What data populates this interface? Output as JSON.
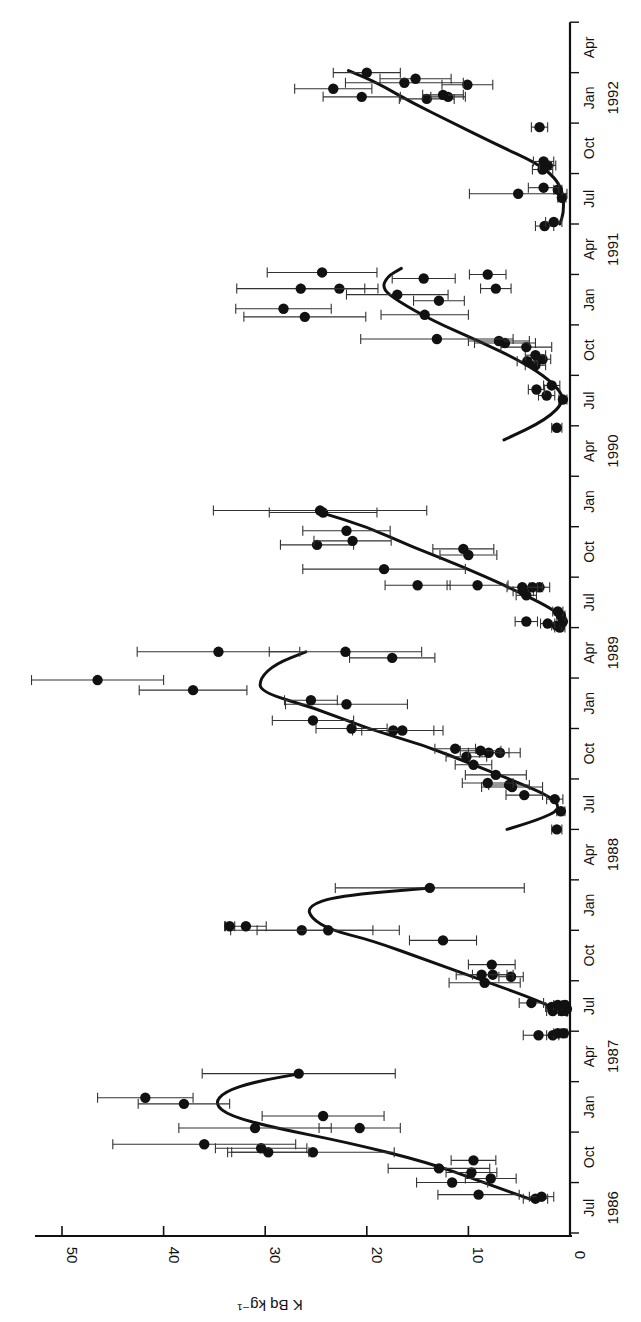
{
  "chart_data": {
    "type": "scatter",
    "orientation": "rotated-90-clockwise",
    "title": "",
    "ylabel": "K Bq kg⁻¹",
    "xlabel": "",
    "ylim": [
      0,
      52
    ],
    "xlim": [
      1986.5,
      1992.5
    ],
    "value_ticks": [
      0,
      10,
      20,
      30,
      40,
      50
    ],
    "month_labels": [
      "Jul",
      "Oct",
      "Jan",
      "Apr",
      "Jul",
      "Oct",
      "Jan",
      "Apr",
      "Jul",
      "Oct",
      "Jan",
      "Apr",
      "Jul",
      "Oct",
      "Jan",
      "Apr",
      "Jul",
      "Oct",
      "Jan",
      "Apr",
      "Jul",
      "Oct",
      "Jan",
      "Apr"
    ],
    "year_labels": [
      {
        "label": "1986",
        "at": 1986.625
      },
      {
        "label": "1987",
        "at": 1987.375
      },
      {
        "label": "1988",
        "at": 1988.375
      },
      {
        "label": "1989",
        "at": 1989.375
      },
      {
        "label": "1990",
        "at": 1990.375
      },
      {
        "label": "1991",
        "at": 1991.375
      },
      {
        "label": "1992",
        "at": 1992.125
      }
    ],
    "grid": false,
    "legend": null,
    "series": [
      {
        "name": "measurements",
        "marker": "filled-circle",
        "points": [
          {
            "t": 1986.67,
            "v": 3.4,
            "e": 1.2
          },
          {
            "t": 1986.68,
            "v": 2.8,
            "e": 1.2
          },
          {
            "t": 1986.69,
            "v": 9.0,
            "e": 4.0
          },
          {
            "t": 1986.75,
            "v": 11.6,
            "e": 3.5
          },
          {
            "t": 1986.77,
            "v": 7.8,
            "e": 2.5
          },
          {
            "t": 1986.8,
            "v": 9.7,
            "e": 2.5
          },
          {
            "t": 1986.82,
            "v": 12.9,
            "e": 5.0
          },
          {
            "t": 1986.86,
            "v": 9.5,
            "e": 2.2
          },
          {
            "t": 1986.9,
            "v": 25.3,
            "e": 8.0
          },
          {
            "t": 1986.9,
            "v": 29.7,
            "e": 4.0
          },
          {
            "t": 1986.92,
            "v": 30.4,
            "e": 4.5
          },
          {
            "t": 1986.94,
            "v": 36.0,
            "e": 9.0
          },
          {
            "t": 1987.02,
            "v": 20.7,
            "e": 4.0
          },
          {
            "t": 1987.02,
            "v": 31.0,
            "e": 7.5
          },
          {
            "t": 1987.08,
            "v": 24.3,
            "e": 6.0
          },
          {
            "t": 1987.14,
            "v": 38.0,
            "e": 4.5
          },
          {
            "t": 1987.17,
            "v": 41.8,
            "e": 4.7
          },
          {
            "t": 1987.29,
            "v": 26.7,
            "e": 9.5
          },
          {
            "t": 1987.48,
            "v": 3.1,
            "e": 1.5
          },
          {
            "t": 1987.48,
            "v": 1.7,
            "e": 0.6
          },
          {
            "t": 1987.49,
            "v": 1.2,
            "e": 0.4
          },
          {
            "t": 1987.49,
            "v": 0.6,
            "e": 0.3
          },
          {
            "t": 1987.6,
            "v": 1.7,
            "e": 0.6
          },
          {
            "t": 1987.6,
            "v": 0.8,
            "e": 0.3
          },
          {
            "t": 1987.61,
            "v": 0.3,
            "e": 0.2
          },
          {
            "t": 1987.62,
            "v": 1.8,
            "e": 0.6
          },
          {
            "t": 1987.63,
            "v": 1.2,
            "e": 0.4
          },
          {
            "t": 1987.63,
            "v": 0.5,
            "e": 0.2
          },
          {
            "t": 1987.64,
            "v": 3.8,
            "e": 1.2
          },
          {
            "t": 1987.74,
            "v": 8.4,
            "e": 3.5
          },
          {
            "t": 1987.77,
            "v": 5.8,
            "e": 1.2
          },
          {
            "t": 1987.78,
            "v": 7.6,
            "e": 2.0
          },
          {
            "t": 1987.78,
            "v": 8.7,
            "e": 2.5
          },
          {
            "t": 1987.83,
            "v": 7.7,
            "e": 2.3
          },
          {
            "t": 1987.95,
            "v": 12.5,
            "e": 3.3
          },
          {
            "t": 1988.0,
            "v": 26.4,
            "e": 7.0
          },
          {
            "t": 1988.0,
            "v": 23.8,
            "e": 7.0
          },
          {
            "t": 1988.02,
            "v": 31.9,
            "e": 2.0
          },
          {
            "t": 1988.02,
            "v": 33.5,
            "e": 0.5
          },
          {
            "t": 1988.21,
            "v": 13.8,
            "e": 9.3
          },
          {
            "t": 1988.5,
            "v": 1.3,
            "e": 0.5
          },
          {
            "t": 1988.59,
            "v": 0.9,
            "e": 0.4
          },
          {
            "t": 1988.65,
            "v": 1.5,
            "e": 0.8
          },
          {
            "t": 1988.67,
            "v": 4.5,
            "e": 1.8
          },
          {
            "t": 1988.71,
            "v": 5.7,
            "e": 3.0
          },
          {
            "t": 1988.72,
            "v": 6.0,
            "e": 2.0
          },
          {
            "t": 1988.73,
            "v": 8.1,
            "e": 2.5
          },
          {
            "t": 1988.77,
            "v": 7.3,
            "e": 3.0
          },
          {
            "t": 1988.82,
            "v": 9.5,
            "e": 1.8
          },
          {
            "t": 1988.86,
            "v": 10.2,
            "e": 2.0
          },
          {
            "t": 1988.88,
            "v": 6.9,
            "e": 2.0
          },
          {
            "t": 1988.88,
            "v": 8.0,
            "e": 2.0
          },
          {
            "t": 1988.89,
            "v": 8.8,
            "e": 2.0
          },
          {
            "t": 1988.9,
            "v": 11.3,
            "e": 2.0
          },
          {
            "t": 1988.99,
            "v": 17.4,
            "e": 4.0
          },
          {
            "t": 1988.99,
            "v": 16.5,
            "e": 4.0
          },
          {
            "t": 1989.0,
            "v": 21.5,
            "e": 3.5
          },
          {
            "t": 1989.04,
            "v": 25.3,
            "e": 4.0
          },
          {
            "t": 1989.12,
            "v": 22.0,
            "e": 6.0
          },
          {
            "t": 1989.14,
            "v": 25.5,
            "e": 2.6
          },
          {
            "t": 1989.19,
            "v": 37.1,
            "e": 5.3
          },
          {
            "t": 1989.24,
            "v": 46.5,
            "e": 6.5
          },
          {
            "t": 1989.35,
            "v": 17.5,
            "e": 4.2
          },
          {
            "t": 1989.38,
            "v": 22.1,
            "e": 7.5
          },
          {
            "t": 1989.38,
            "v": 34.6,
            "e": 8.0
          },
          {
            "t": 1989.5,
            "v": 1.0,
            "e": 0.5
          },
          {
            "t": 1989.51,
            "v": 1.3,
            "e": 0.5
          },
          {
            "t": 1989.52,
            "v": 2.2,
            "e": 0.7
          },
          {
            "t": 1989.53,
            "v": 0.7,
            "e": 0.3
          },
          {
            "t": 1989.53,
            "v": 4.3,
            "e": 1.1
          },
          {
            "t": 1989.56,
            "v": 0.9,
            "e": 0.4
          },
          {
            "t": 1989.58,
            "v": 1.2,
            "e": 0.5
          },
          {
            "t": 1989.66,
            "v": 4.3,
            "e": 1.0
          },
          {
            "t": 1989.68,
            "v": 4.6,
            "e": 1.0
          },
          {
            "t": 1989.7,
            "v": 3.0,
            "e": 1.0
          },
          {
            "t": 1989.7,
            "v": 3.7,
            "e": 1.0
          },
          {
            "t": 1989.7,
            "v": 4.7,
            "e": 1.5
          },
          {
            "t": 1989.71,
            "v": 9.1,
            "e": 3.0
          },
          {
            "t": 1989.71,
            "v": 15.0,
            "e": 3.2
          },
          {
            "t": 1989.79,
            "v": 18.3,
            "e": 8.0
          },
          {
            "t": 1989.86,
            "v": 10.0,
            "e": 2.8
          },
          {
            "t": 1989.89,
            "v": 10.5,
            "e": 3.0
          },
          {
            "t": 1989.91,
            "v": 24.9,
            "e": 3.6
          },
          {
            "t": 1989.93,
            "v": 21.4,
            "e": 3.8
          },
          {
            "t": 1989.98,
            "v": 22.0,
            "e": 4.3
          },
          {
            "t": 1990.07,
            "v": 24.3,
            "e": 5.3
          },
          {
            "t": 1990.08,
            "v": 24.6,
            "e": 10.5
          },
          {
            "t": 1990.49,
            "v": 1.3,
            "e": 0.5
          },
          {
            "t": 1990.63,
            "v": 0.7,
            "e": 0.4
          },
          {
            "t": 1990.65,
            "v": 2.3,
            "e": 0.8
          },
          {
            "t": 1990.68,
            "v": 3.3,
            "e": 0.8
          },
          {
            "t": 1990.7,
            "v": 1.8,
            "e": 0.8
          },
          {
            "t": 1990.8,
            "v": 3.4,
            "e": 1.0
          },
          {
            "t": 1990.82,
            "v": 4.2,
            "e": 1.0
          },
          {
            "t": 1990.83,
            "v": 2.7,
            "e": 0.8
          },
          {
            "t": 1990.85,
            "v": 3.4,
            "e": 1.0
          },
          {
            "t": 1990.89,
            "v": 4.3,
            "e": 2.5
          },
          {
            "t": 1990.91,
            "v": 6.4,
            "e": 3.0
          },
          {
            "t": 1990.92,
            "v": 7.0,
            "e": 3.0
          },
          {
            "t": 1990.93,
            "v": 13.1,
            "e": 7.5
          },
          {
            "t": 1991.04,
            "v": 26.1,
            "e": 6.0
          },
          {
            "t": 1991.05,
            "v": 14.3,
            "e": 4.3
          },
          {
            "t": 1991.08,
            "v": 28.2,
            "e": 4.7
          },
          {
            "t": 1991.12,
            "v": 12.9,
            "e": 2.5
          },
          {
            "t": 1991.15,
            "v": 17.0,
            "e": 5.0
          },
          {
            "t": 1991.18,
            "v": 22.7,
            "e": 3.8
          },
          {
            "t": 1991.18,
            "v": 26.5,
            "e": 6.3
          },
          {
            "t": 1991.18,
            "v": 7.3,
            "e": 1.5
          },
          {
            "t": 1991.23,
            "v": 14.4,
            "e": 3.1
          },
          {
            "t": 1991.25,
            "v": 8.1,
            "e": 1.8
          },
          {
            "t": 1991.26,
            "v": 24.4,
            "e": 5.4
          },
          {
            "t": 1991.49,
            "v": 2.5,
            "e": 0.9
          },
          {
            "t": 1991.51,
            "v": 1.6,
            "e": 0.8
          },
          {
            "t": 1991.63,
            "v": 0.8,
            "e": 0.4
          },
          {
            "t": 1991.65,
            "v": 5.1,
            "e": 4.8
          },
          {
            "t": 1991.67,
            "v": 1.2,
            "e": 0.4
          },
          {
            "t": 1991.68,
            "v": 2.6,
            "e": 1.5
          },
          {
            "t": 1991.77,
            "v": 2.7,
            "e": 1.0
          },
          {
            "t": 1991.79,
            "v": 2.2,
            "e": 0.8
          },
          {
            "t": 1991.81,
            "v": 2.6,
            "e": 1.0
          },
          {
            "t": 1991.98,
            "v": 3.0,
            "e": 0.8
          },
          {
            "t": 1992.12,
            "v": 14.1,
            "e": 2.7
          },
          {
            "t": 1992.13,
            "v": 12.0,
            "e": 1.7
          },
          {
            "t": 1992.13,
            "v": 20.5,
            "e": 3.8
          },
          {
            "t": 1992.14,
            "v": 12.5,
            "e": 2.0
          },
          {
            "t": 1992.17,
            "v": 23.3,
            "e": 3.8
          },
          {
            "t": 1992.19,
            "v": 10.1,
            "e": 2.5
          },
          {
            "t": 1992.2,
            "v": 16.3,
            "e": 5.8
          },
          {
            "t": 1992.22,
            "v": 15.2,
            "e": 3.5
          },
          {
            "t": 1992.25,
            "v": 20.0,
            "e": 3.3
          }
        ]
      },
      {
        "name": "fitted seasonal curve",
        "type": "line",
        "segments": [
          [
            [
              1986.66,
              3.5
            ],
            [
              1986.75,
              8.5
            ],
            [
              1986.85,
              14
            ],
            [
              1986.95,
              22
            ],
            [
              1987.02,
              29
            ],
            [
              1987.08,
              33.5
            ],
            [
              1987.14,
              35
            ],
            [
              1987.2,
              34
            ],
            [
              1987.25,
              31
            ],
            [
              1987.29,
              26.5
            ]
          ],
          [
            [
              1987.58,
              0.3
            ],
            [
              1987.65,
              3
            ],
            [
              1987.75,
              8.5
            ],
            [
              1987.85,
              14
            ],
            [
              1987.95,
              19.5
            ],
            [
              1988.0,
              23.5
            ],
            [
              1988.06,
              25.5
            ],
            [
              1988.12,
              25.8
            ],
            [
              1988.17,
              23
            ],
            [
              1988.21,
              13.8
            ]
          ],
          [
            [
              1988.5,
              6.2
            ],
            [
              1988.55,
              3
            ],
            [
              1988.6,
              0.9
            ],
            [
              1988.66,
              1.8
            ],
            [
              1988.73,
              5
            ],
            [
              1988.82,
              9.5
            ],
            [
              1988.92,
              14.5
            ],
            [
              1989.0,
              20
            ],
            [
              1989.1,
              25
            ],
            [
              1989.18,
              30.5
            ],
            [
              1989.25,
              30.5
            ],
            [
              1989.32,
              29
            ],
            [
              1989.38,
              26
            ]
          ],
          [
            [
              1989.52,
              0.5
            ],
            [
              1989.58,
              1.2
            ],
            [
              1989.7,
              6
            ],
            [
              1989.8,
              10.5
            ],
            [
              1989.9,
              15.5
            ],
            [
              1990.0,
              20
            ],
            [
              1990.07,
              24.5
            ]
          ],
          [
            [
              1990.43,
              6.5
            ],
            [
              1990.53,
              2.3
            ],
            [
              1990.63,
              0.4
            ],
            [
              1990.72,
              1.8
            ],
            [
              1990.82,
              4.8
            ],
            [
              1990.92,
              9
            ],
            [
              1991.02,
              13.5
            ],
            [
              1991.12,
              17
            ],
            [
              1991.18,
              18.5
            ],
            [
              1991.24,
              18.0
            ],
            [
              1991.28,
              16.6
            ]
          ],
          [
            [
              1991.5,
              1.0
            ],
            [
              1991.56,
              0.6
            ],
            [
              1991.66,
              0.7
            ],
            [
              1991.73,
              1.5
            ],
            [
              1991.8,
              3.2
            ],
            [
              1991.9,
              7.5
            ],
            [
              1992.0,
              11.5
            ],
            [
              1992.1,
              15.5
            ],
            [
              1992.2,
              19
            ],
            [
              1992.26,
              21.8
            ]
          ]
        ]
      }
    ]
  }
}
